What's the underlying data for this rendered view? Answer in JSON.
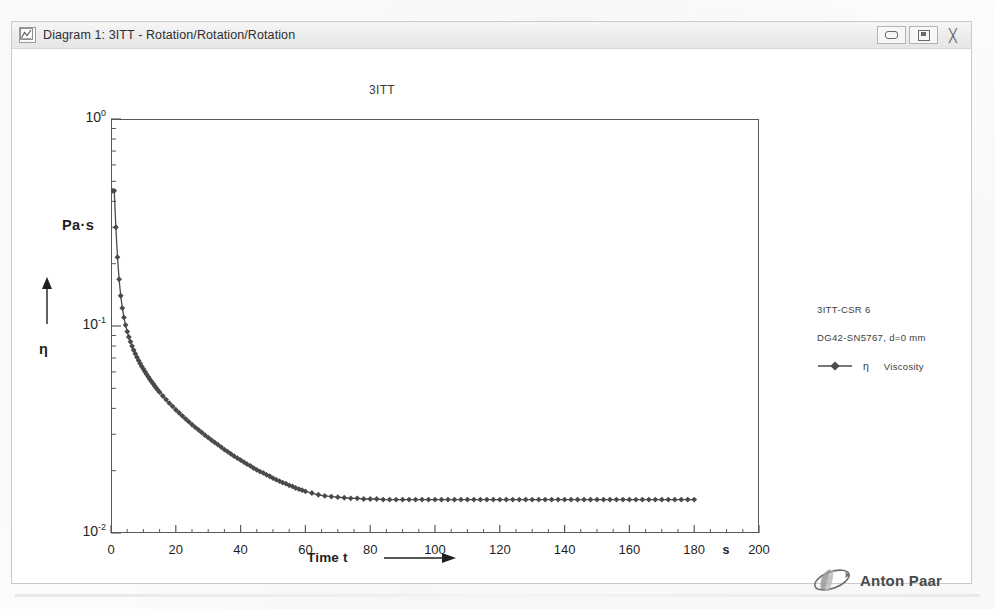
{
  "window": {
    "title": "Diagram 1: 3ITT - Rotation/Rotation/Rotation",
    "icon": "diagram-icon",
    "controls": {
      "minimize": "–",
      "maximize": "□",
      "close": "╳"
    }
  },
  "legend": {
    "line1": "3ITT-CSR 6",
    "line2": "DG42-SN5767, d=0 mm",
    "series_symbol": "η",
    "series_name": "Viscosity"
  },
  "brand": {
    "name": "Anton Paar",
    "footnote": "Anton Paar GmbH"
  },
  "chart_data": {
    "type": "line",
    "title": "3ITT",
    "xlabel": "Time t",
    "xunit": "s",
    "ylabel": "η",
    "yunit": "Pa·s",
    "xscale": "linear",
    "yscale": "log",
    "xlim": [
      0,
      200
    ],
    "ylim": [
      0.01,
      1
    ],
    "xticks": [
      0,
      20,
      40,
      60,
      80,
      100,
      120,
      140,
      160,
      180,
      200
    ],
    "xticklabels": [
      "0",
      "20",
      "40",
      "60",
      "80",
      "100",
      "120",
      "140",
      "160",
      "180",
      "200"
    ],
    "yticks": [
      0.01,
      0.1,
      1
    ],
    "yticklabels": [
      "10⁻²",
      "10⁻¹",
      "10⁰"
    ],
    "grid": false,
    "legend_position": "right",
    "marker": "diamond",
    "line_color": "#4a4a4a",
    "marker_color": "#4a4a4a",
    "series": [
      {
        "name": "Viscosity",
        "symbol": "η",
        "x": [
          0.5,
          1,
          1.5,
          2,
          2.5,
          3,
          3.5,
          4,
          4.5,
          5,
          5.5,
          6,
          6.5,
          7,
          7.5,
          8,
          8.5,
          9,
          9.5,
          10,
          10.5,
          11,
          11.5,
          12,
          12.5,
          13,
          13.5,
          14,
          14.5,
          15,
          16,
          17,
          18,
          19,
          20,
          21,
          22,
          23,
          24,
          25,
          26,
          27,
          28,
          29,
          30,
          31,
          32,
          33,
          34,
          35,
          36,
          37,
          38,
          39,
          40,
          41,
          42,
          43,
          44,
          45,
          46,
          47,
          48,
          49,
          50,
          51,
          52,
          53,
          54,
          55,
          56,
          57,
          58,
          59,
          60,
          62,
          64,
          66,
          68,
          70,
          72,
          74,
          76,
          78,
          80,
          82,
          84,
          86,
          88,
          90,
          92,
          94,
          96,
          98,
          100,
          102,
          104,
          106,
          108,
          110,
          112,
          114,
          116,
          118,
          120,
          122,
          124,
          126,
          128,
          130,
          132,
          134,
          136,
          138,
          140,
          142,
          144,
          146,
          148,
          150,
          152,
          154,
          156,
          158,
          160,
          162,
          164,
          166,
          168,
          170,
          172,
          174,
          176,
          178,
          180
        ],
        "y": [
          0.45,
          0.45,
          0.3,
          0.215,
          0.168,
          0.14,
          0.122,
          0.11,
          0.101,
          0.094,
          0.0885,
          0.084,
          0.08,
          0.0765,
          0.0735,
          0.0707,
          0.0682,
          0.0659,
          0.0638,
          0.0619,
          0.0601,
          0.0584,
          0.0568,
          0.0553,
          0.0539,
          0.0526,
          0.0513,
          0.0501,
          0.049,
          0.0479,
          0.0459,
          0.0441,
          0.0424,
          0.0409,
          0.0394,
          0.0381,
          0.0368,
          0.0356,
          0.0345,
          0.0334,
          0.0324,
          0.0315,
          0.0306,
          0.0297,
          0.0289,
          0.0281,
          0.0274,
          0.0267,
          0.026,
          0.0253,
          0.0247,
          0.0241,
          0.0235,
          0.023,
          0.0225,
          0.022,
          0.0215,
          0.0211,
          0.0206,
          0.0202,
          0.0198,
          0.0195,
          0.0191,
          0.0188,
          0.0184,
          0.0181,
          0.0178,
          0.0175,
          0.0173,
          0.017,
          0.0168,
          0.0165,
          0.0163,
          0.0161,
          0.0159,
          0.0156,
          0.0153,
          0.0151,
          0.015,
          0.0149,
          0.0148,
          0.0147,
          0.0147,
          0.0146,
          0.0146,
          0.0146,
          0.0145,
          0.0145,
          0.0145,
          0.0145,
          0.0145,
          0.0145,
          0.0145,
          0.0145,
          0.0145,
          0.0145,
          0.0145,
          0.0145,
          0.0145,
          0.0145,
          0.0145,
          0.0145,
          0.0145,
          0.0145,
          0.0145,
          0.0145,
          0.0145,
          0.0145,
          0.0145,
          0.0145,
          0.0145,
          0.0145,
          0.0145,
          0.0145,
          0.0145,
          0.0145,
          0.0145,
          0.0145,
          0.0145,
          0.0145,
          0.0145,
          0.0145,
          0.0145,
          0.0145,
          0.0145,
          0.0145,
          0.0145,
          0.0145,
          0.0145,
          0.0145,
          0.0145,
          0.0145,
          0.0145,
          0.0145,
          0.0145
        ]
      }
    ]
  }
}
